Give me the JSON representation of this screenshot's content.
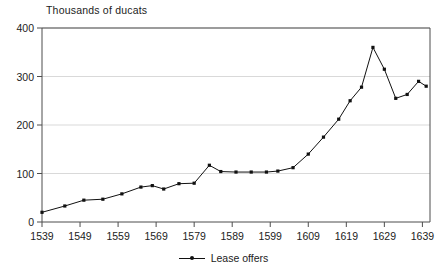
{
  "chart_data": {
    "type": "line",
    "title": "",
    "ylabel": "Thousands of ducats",
    "xlabel": "",
    "ylim": [
      0,
      400
    ],
    "xlim": [
      1539,
      1641
    ],
    "grid": true,
    "legend_position": "bottom",
    "ytick_labels": [
      "0",
      "100",
      "200",
      "300",
      "400"
    ],
    "ytick_values": [
      0,
      100,
      200,
      300,
      400
    ],
    "xtick_labels": [
      "1539",
      "1549",
      "1559",
      "1569",
      "1579",
      "1589",
      "1599",
      "1609",
      "1619",
      "1629",
      "1639"
    ],
    "xtick_values": [
      1539,
      1549,
      1559,
      1569,
      1579,
      1589,
      1599,
      1609,
      1619,
      1629,
      1639
    ],
    "series": [
      {
        "name": "Lease offers",
        "color": "#111111",
        "marker": "dot",
        "x": [
          1539,
          1545,
          1550,
          1555,
          1560,
          1565,
          1568,
          1571,
          1575,
          1579,
          1583,
          1586,
          1590,
          1594,
          1598,
          1601,
          1605,
          1609,
          1613,
          1617,
          1620,
          1623,
          1626,
          1629,
          1632,
          1635,
          1638,
          1640
        ],
        "values": [
          20,
          33,
          45,
          47,
          58,
          72,
          75,
          68,
          79,
          80,
          117,
          104,
          103,
          103,
          103,
          105,
          112,
          140,
          175,
          212,
          250,
          278,
          360,
          315,
          255,
          263,
          290,
          280
        ]
      }
    ],
    "legend": [
      {
        "label": "Lease offers"
      }
    ]
  },
  "colors": {
    "line": "#111111",
    "grid": "#d9d9d9",
    "axis": "#4d4d4d",
    "text": "#222222",
    "background": "#ffffff"
  }
}
